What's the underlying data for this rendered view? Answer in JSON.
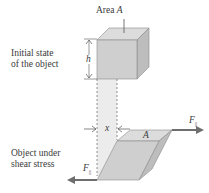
{
  "labels": {
    "area_top": "Area ",
    "area_top_var": "A",
    "initial_line1": "Initial state",
    "initial_line2": "of the object",
    "height_var": "h",
    "displacement_var": "x",
    "top_face_var": "A",
    "force_right": "F",
    "force_right_sub": "||",
    "force_left": "F",
    "force_left_sub": "||",
    "shear_line1": "Object under",
    "shear_line2": "shear stress"
  },
  "colors": {
    "cube_front": "#cfcfcf",
    "cube_top": "#dcdcdc",
    "cube_side": "#bdbdbd",
    "edge": "#8a8a8a",
    "arrow": "#6e6e6e",
    "shade_band": "#ececec"
  }
}
